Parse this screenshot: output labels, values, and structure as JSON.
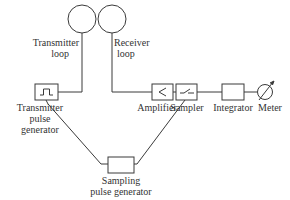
{
  "diagram": {
    "type": "block-diagram",
    "stroke_color": "#3a3a3a",
    "background": "#ffffff",
    "nodes": [
      {
        "id": "transmitter_loop",
        "label_lines": [
          "Transmitter",
          "loop"
        ],
        "shape": "circle"
      },
      {
        "id": "receiver_loop",
        "label_lines": [
          "Receiver",
          "loop"
        ],
        "shape": "circle"
      },
      {
        "id": "transmitter_pulse_generator",
        "label_lines": [
          "Transmitter",
          "pulse",
          "generator"
        ],
        "shape": "box",
        "icon": "square-pulse-icon"
      },
      {
        "id": "amplifier",
        "label_lines": [
          "Amplifier"
        ],
        "shape": "box",
        "icon": "amplifier-triangle-icon"
      },
      {
        "id": "sampler",
        "label_lines": [
          "Sampler"
        ],
        "shape": "box",
        "icon": "switch-icon"
      },
      {
        "id": "integrator",
        "label_lines": [
          "Integrator"
        ],
        "shape": "box"
      },
      {
        "id": "meter",
        "label_lines": [
          "Meter"
        ],
        "shape": "meter-circle",
        "icon": "meter-needle-icon"
      },
      {
        "id": "sampling_pulse_generator",
        "label_lines": [
          "Sampling",
          "pulse generator"
        ],
        "shape": "box"
      }
    ],
    "edges": [
      {
        "from": "transmitter_pulse_generator",
        "to": "transmitter_loop"
      },
      {
        "from": "receiver_loop",
        "to": "amplifier"
      },
      {
        "from": "amplifier",
        "to": "sampler"
      },
      {
        "from": "sampler",
        "to": "integrator"
      },
      {
        "from": "integrator",
        "to": "meter"
      },
      {
        "from": "transmitter_pulse_generator",
        "to": "sampling_pulse_generator"
      },
      {
        "from": "sampling_pulse_generator",
        "to": "sampler"
      }
    ]
  },
  "labels": {
    "transmitter_loop": {
      "l1": "Transmitter",
      "l2": "loop"
    },
    "receiver_loop": {
      "l1": "Receiver",
      "l2": "loop"
    },
    "transmitter_pulse_generator": {
      "l1": "Transmitter",
      "l2": "pulse",
      "l3": "generator"
    },
    "amplifier": "Amplifier",
    "sampler": "Sampler",
    "integrator": "Integrator",
    "meter": "Meter",
    "sampling_pulse_generator": {
      "l1": "Sampling",
      "l2": "pulse generator"
    }
  }
}
